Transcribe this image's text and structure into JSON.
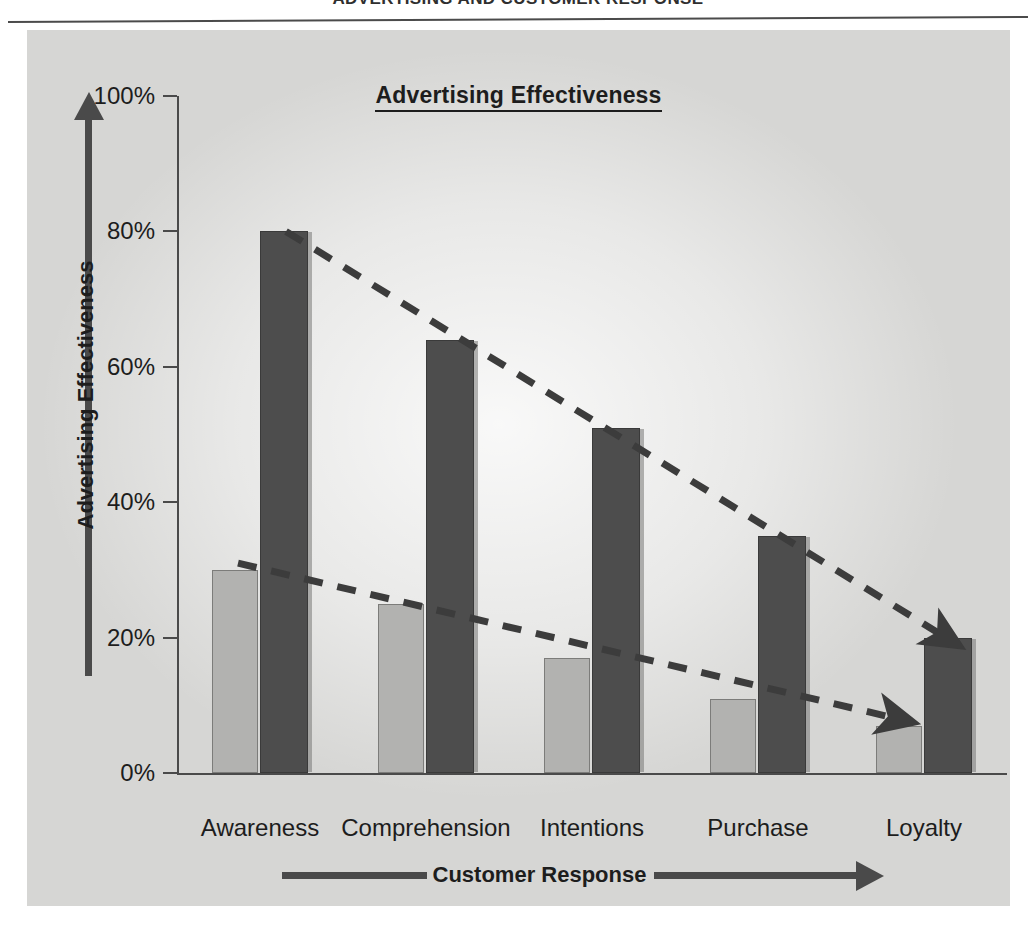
{
  "page": {
    "running_head": "ADVERTISING AND CUSTOMER RESPONSE"
  },
  "chart": {
    "title": "Advertising Effectiveness",
    "y_axis_caption": "Advertising Effectiveness",
    "x_axis_caption": "Customer Response",
    "y_ticks": [
      "100%",
      "80%",
      "60%",
      "40%",
      "20%",
      "0%"
    ],
    "colors": {
      "panel_background": "#d6d6d4",
      "light_bar": "#b2b2b0",
      "dark_bar": "#4d4d4d",
      "axis": "#4a4a4a",
      "text": "#1d1d1d"
    }
  },
  "chart_data": {
    "type": "bar",
    "title": "Advertising Effectiveness",
    "subtitle": "",
    "xlabel": "Customer Response",
    "ylabel": "Advertising Effectiveness",
    "ylim": [
      0,
      100
    ],
    "yticks": [
      0,
      20,
      40,
      60,
      80,
      100
    ],
    "ytick_labels": [
      "0%",
      "20%",
      "40%",
      "60%",
      "80%",
      "100%"
    ],
    "grid": false,
    "legend": false,
    "legend_position": "none",
    "categories": [
      "Awareness",
      "Comprehension",
      "Intentions",
      "Purchase",
      "Loyalty"
    ],
    "series": [
      {
        "name": "Low effectiveness",
        "color": "#b2b2b0",
        "values": [
          30,
          25,
          17,
          11,
          7
        ]
      },
      {
        "name": "High effectiveness",
        "color": "#4d4d4d",
        "values": [
          80,
          64,
          51,
          35,
          20
        ]
      }
    ],
    "annotations": [
      {
        "type": "trend-arrow",
        "style": "dashed",
        "label": "",
        "from": {
          "category": "Awareness",
          "value": 80
        },
        "to": {
          "category": "Loyalty",
          "value": 20
        }
      },
      {
        "type": "trend-arrow",
        "style": "dashed",
        "label": "",
        "from": {
          "category": "Awareness",
          "value": 31
        },
        "to": {
          "category": "Loyalty",
          "value": 8
        }
      }
    ]
  }
}
